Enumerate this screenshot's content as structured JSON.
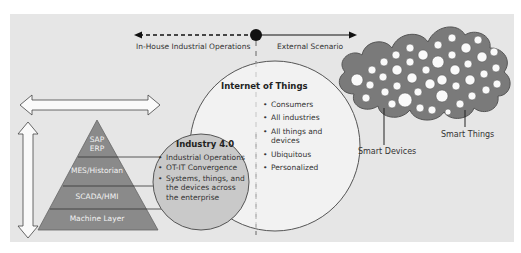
{
  "scope": {
    "left_label": "In-House Industrial Operations",
    "right_label": "External Scenario"
  },
  "pyramid": {
    "layers": [
      {
        "label": "SAP\nERP"
      },
      {
        "label": "MES/Historian"
      },
      {
        "label": "SCADA/HMI"
      },
      {
        "label": "Machine Layer"
      }
    ],
    "sap_line1": "SAP",
    "sap_line2": "ERP"
  },
  "industry40": {
    "title": "Industry 4.0",
    "items": [
      "Industrial Operations",
      "OT-IT Convergence",
      "Systems, things, and the devices across the enterprise"
    ]
  },
  "iot": {
    "title": "Internet of Things",
    "items": [
      "Consumers",
      "All industries",
      "All things and devices",
      "Ubiquitous",
      "Personalized"
    ]
  },
  "cloud": {
    "smart_devices_label": "Smart Devices",
    "smart_things_label": "Smart Things"
  },
  "colors": {
    "background": "#e6e6e6",
    "pyramid": "#8c8c8c",
    "industry_circle": "#c9c9c9",
    "iot_circle": "#f2f2f2",
    "cloud": "#7a7a7a"
  }
}
